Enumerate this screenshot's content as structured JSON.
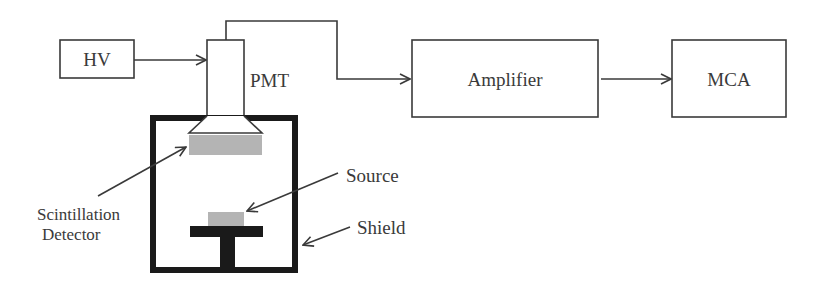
{
  "diagram": {
    "type": "block-diagram",
    "blocks": [
      {
        "id": "hv",
        "label": "HV"
      },
      {
        "id": "pmt",
        "label": "PMT"
      },
      {
        "id": "amplifier",
        "label": "Amplifier"
      },
      {
        "id": "mca",
        "label": "MCA"
      }
    ],
    "annotations": {
      "detector_line1": "Scintillation",
      "detector_line2": "Detector",
      "source": "Source",
      "shield": "Shield"
    },
    "connections": [
      {
        "from": "HV",
        "to": "PMT"
      },
      {
        "from": "PMT",
        "to": "Amplifier"
      },
      {
        "from": "Amplifier",
        "to": "MCA"
      }
    ],
    "colors": {
      "line": "#3a3a3a",
      "shield": "#1a1a1a",
      "crystal": "#b4b4b4",
      "background": "#ffffff"
    }
  }
}
